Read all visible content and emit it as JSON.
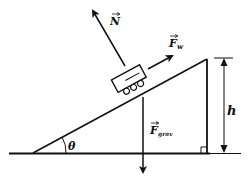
{
  "diagram": {
    "colors": {
      "line": "#111111",
      "background": "#ffffff"
    },
    "labels": {
      "normal_force": "N",
      "wind_force_main": "F",
      "wind_force_sub": "w",
      "gravity_force_main": "F",
      "gravity_force_sub": "grav",
      "height": "h",
      "angle": "θ"
    },
    "elements": [
      "ground-line",
      "incline-surface",
      "vertical-side",
      "right-angle-marker",
      "height-dimension",
      "angle-arc",
      "cart",
      "normal-force-arrow",
      "wind-force-arrow",
      "gravity-force-arrow"
    ]
  }
}
